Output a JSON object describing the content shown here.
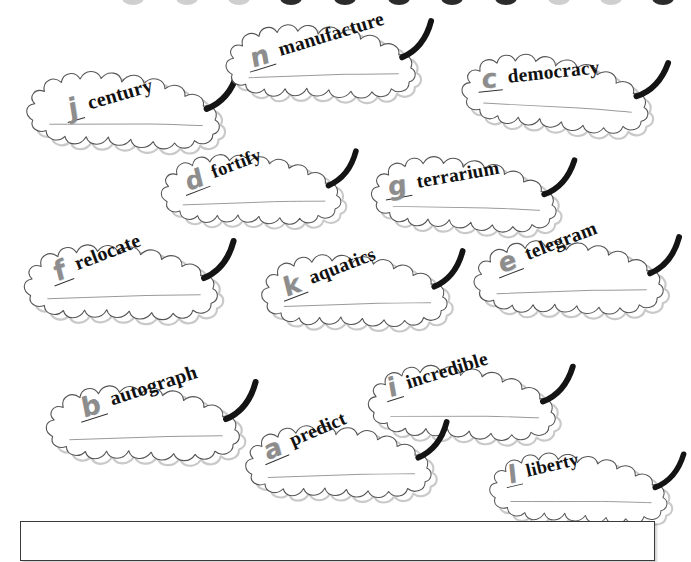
{
  "page": {
    "background_color": "#ffffff",
    "leaf_outline_color": "#555555",
    "letter_color": "#8d8d8d",
    "word_color": "#111111",
    "stem_color": "#141414"
  },
  "top_border": {
    "name": "cut-off-leaf-stems",
    "nub_count": 11,
    "nubs": [
      {
        "x": 176,
        "faint": true
      },
      {
        "x": 228,
        "faint": true
      },
      {
        "x": 280,
        "faint": false
      },
      {
        "x": 334,
        "faint": false
      },
      {
        "x": 388,
        "faint": false
      },
      {
        "x": 441,
        "faint": false
      },
      {
        "x": 495,
        "faint": false
      },
      {
        "x": 548,
        "faint": true
      },
      {
        "x": 600,
        "faint": true
      },
      {
        "x": 652,
        "faint": false
      },
      {
        "x": 122,
        "faint": true
      }
    ]
  },
  "leaves": [
    {
      "id": "leaf-century",
      "letter": "j",
      "word": "century",
      "x": 14,
      "y": 66,
      "rot": -7,
      "scale": 1.0,
      "flip": false,
      "label_x": 46,
      "label_y": 38,
      "label_rot": -9
    },
    {
      "id": "leaf-manufacture",
      "letter": "n",
      "word": "manufacture",
      "x": 212,
      "y": 22,
      "rot": -9,
      "scale": 0.98,
      "flip": false,
      "label_x": 30,
      "label_y": 32,
      "label_rot": -8
    },
    {
      "id": "leaf-democracy",
      "letter": "c",
      "word": "democracy",
      "x": 452,
      "y": 45,
      "rot": -4,
      "scale": 0.97,
      "flip": false,
      "label_x": 25,
      "label_y": 26,
      "label_rot": -2
    },
    {
      "id": "leaf-fortify",
      "letter": "d",
      "word": "fortify",
      "x": 148,
      "y": 152,
      "rot": -9,
      "scale": 0.93,
      "flip": false,
      "label_x": 32,
      "label_y": 28,
      "label_rot": -12
    },
    {
      "id": "leaf-terrarium",
      "letter": "g",
      "word": "terrarium",
      "x": 360,
      "y": 150,
      "rot": -6,
      "scale": 0.96,
      "flip": false,
      "label_x": 22,
      "label_y": 30,
      "label_rot": -4
    },
    {
      "id": "leaf-relocate",
      "letter": "f",
      "word": "relocate",
      "x": 10,
      "y": 242,
      "rot": -9,
      "scale": 1.0,
      "flip": false,
      "label_x": 36,
      "label_y": 26,
      "label_rot": -12
    },
    {
      "id": "leaf-aquatics",
      "letter": "k",
      "word": "aquatics",
      "x": 248,
      "y": 252,
      "rot": -9,
      "scale": 0.96,
      "flip": false,
      "label_x": 28,
      "label_y": 32,
      "label_rot": -12
    },
    {
      "id": "leaf-telegram",
      "letter": "e",
      "word": "telegram",
      "x": 460,
      "y": 238,
      "rot": -9,
      "scale": 0.98,
      "flip": false,
      "label_x": 32,
      "label_y": 22,
      "label_rot": -12
    },
    {
      "id": "leaf-autograph",
      "letter": "b",
      "word": "autograph",
      "x": 32,
      "y": 383,
      "rot": -9,
      "scale": 1.0,
      "flip": false,
      "label_x": 42,
      "label_y": 22,
      "label_rot": -9
    },
    {
      "id": "leaf-incredible",
      "letter": "i",
      "word": "incredible",
      "x": 356,
      "y": 360,
      "rot": -7,
      "scale": 0.97,
      "flip": false,
      "label_x": 26,
      "label_y": 22,
      "label_rot": -10
    },
    {
      "id": "leaf-predict",
      "letter": "a",
      "word": "predict",
      "x": 232,
      "y": 423,
      "rot": -9,
      "scale": 0.96,
      "flip": false,
      "label_x": 26,
      "label_y": 24,
      "label_rot": -14
    },
    {
      "id": "leaf-liberty",
      "letter": "l",
      "word": "liberty",
      "x": 478,
      "y": 448,
      "rot": -7,
      "scale": 0.92,
      "flip": false,
      "label_x": 26,
      "label_y": 22,
      "label_rot": -6
    }
  ],
  "answer_box": {
    "name": "answer-box",
    "x": 20,
    "y": 521,
    "width": 635,
    "height": 40,
    "border_color": "#3a3a3a",
    "text": ""
  }
}
